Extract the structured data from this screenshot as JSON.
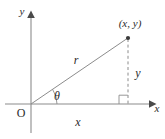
{
  "figure": {
    "type": "polar-coordinate-right-triangle-diagram",
    "background_color": "#ffffff",
    "line_color": "#8c8c8c",
    "text_color": "#2b2b2b",
    "labels": {
      "y_axis": "y",
      "x_axis": "x",
      "origin": "O",
      "point": "(x, y)",
      "hypotenuse": "r",
      "angle": "θ",
      "opposite_side": "y",
      "adjacent_side": "x"
    },
    "geometry": {
      "origin": {
        "x": 31,
        "y": 104
      },
      "point": {
        "x": 128,
        "y": 38
      },
      "foot": {
        "x": 128,
        "y": 104
      },
      "x_axis_start": {
        "x": 5,
        "y": 104
      },
      "x_axis_end": {
        "x": 153,
        "y": 104
      },
      "y_axis_top": {
        "x": 31,
        "y": 13
      },
      "y_axis_bottom": {
        "x": 31,
        "y": 133
      },
      "angle_degrees": 34,
      "arc_radius": 26,
      "right_angle_size": 9
    },
    "label_positions": {
      "y_axis": {
        "x": 22,
        "y": 15
      },
      "x_axis": {
        "x": 157,
        "y": 111
      },
      "origin": {
        "x": 21,
        "y": 116
      },
      "point": {
        "x": 110,
        "y": 29
      },
      "hypotenuse": {
        "x": 76,
        "y": 62
      },
      "angle": {
        "x": 56,
        "y": 99
      },
      "opposite_side": {
        "x": 136,
        "y": 76
      },
      "adjacent_side": {
        "x": 77,
        "y": 124
      }
    }
  }
}
